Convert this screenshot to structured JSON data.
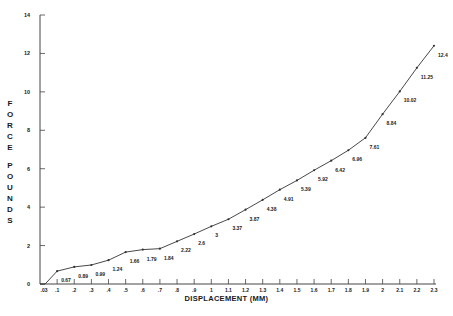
{
  "chart_data": {
    "type": "line",
    "title": "",
    "xlabel": "DISPLACEMENT (MM)",
    "ylabel": "FORCE POUNDS",
    "ylabel_words": [
      "FORCE",
      "POUNDS"
    ],
    "xlim": [
      0,
      2.3
    ],
    "ylim": [
      0,
      14
    ],
    "grid": false,
    "legend": null,
    "x_ticks": [
      ".03",
      ".1",
      ".2",
      ".3",
      ".4",
      ".5",
      ".6",
      ".7",
      ".8",
      ".9",
      "1",
      "1.1",
      "1.2",
      "1.3",
      "1.4",
      "1.5",
      "1.6",
      "1.7",
      "1.8",
      "1.9",
      "2",
      "2.1",
      "2.2",
      "2.3"
    ],
    "x_tick_values": [
      0.03,
      0.1,
      0.2,
      0.3,
      0.4,
      0.5,
      0.6,
      0.7,
      0.8,
      0.9,
      1.0,
      1.1,
      1.2,
      1.3,
      1.4,
      1.5,
      1.6,
      1.7,
      1.8,
      1.9,
      2.0,
      2.1,
      2.2,
      2.3
    ],
    "y_ticks": [
      "0",
      "2",
      "4",
      "6",
      "8",
      "10",
      "12",
      "14"
    ],
    "y_tick_values": [
      0,
      2,
      4,
      6,
      8,
      10,
      12,
      14
    ],
    "series": [
      {
        "name": "Force vs Displacement",
        "x": [
          0.03,
          0.1,
          0.2,
          0.3,
          0.4,
          0.5,
          0.6,
          0.7,
          0.8,
          0.9,
          1.0,
          1.1,
          1.2,
          1.3,
          1.4,
          1.5,
          1.6,
          1.7,
          1.8,
          1.9,
          2.0,
          2.1,
          2.2,
          2.3
        ],
        "values": [
          0,
          0.67,
          0.89,
          0.99,
          1.24,
          1.66,
          1.79,
          1.84,
          2.22,
          2.6,
          3,
          3.37,
          3.87,
          4.38,
          4.91,
          5.39,
          5.92,
          6.42,
          6.96,
          7.61,
          8.84,
          10.02,
          11.25,
          12.4
        ],
        "labels": [
          "",
          "0.67",
          "0.89",
          "0.99",
          "1.24",
          "1.66",
          "1.79",
          "1.84",
          "2.22",
          "2.6",
          "3",
          "3.37",
          "3.87",
          "4.38",
          "4.91",
          "5.39",
          "5.92",
          "6.42",
          "6.96",
          "7.61",
          "8.84",
          "10.02",
          "11.25",
          "12.4"
        ]
      }
    ]
  },
  "colors": {
    "line": "#333333",
    "axis": "#444444",
    "text": "#1a1a1a",
    "background": "#ffffff"
  }
}
